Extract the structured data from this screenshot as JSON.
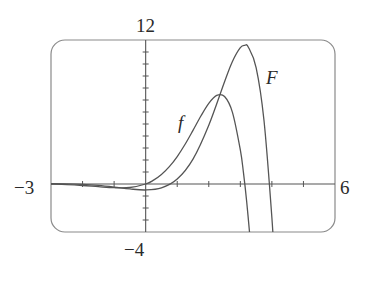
{
  "chart_data": {
    "type": "line",
    "title": "",
    "xlabel": "",
    "ylabel": "",
    "xlim": [
      -3,
      6
    ],
    "ylim": [
      -4,
      12
    ],
    "x_tick_step": 1,
    "y_tick_step": 1,
    "grid": false,
    "legend": "inline curve labels",
    "axis_labels": {
      "x_min": "−3",
      "x_max": "6",
      "y_max": "12",
      "y_min": "−4"
    },
    "series": [
      {
        "name": "f",
        "label": "f",
        "points": [
          [
            -3,
            -0.007
          ],
          [
            -2.5,
            -0.049
          ],
          [
            -2,
            -0.123
          ],
          [
            -1.5,
            -0.223
          ],
          [
            -1,
            -0.31
          ],
          [
            -0.5,
            -0.291
          ],
          [
            0,
            0
          ],
          [
            0.25,
            0.318
          ],
          [
            0.5,
            0.79
          ],
          [
            0.75,
            1.443
          ],
          [
            1,
            2.287
          ],
          [
            1.25,
            3.312
          ],
          [
            1.5,
            4.47
          ],
          [
            1.75,
            5.663
          ],
          [
            2,
            6.719
          ],
          [
            2.25,
            7.382
          ],
          [
            2.5,
            7.29
          ],
          [
            2.75,
            5.97
          ],
          [
            3,
            2.834
          ],
          [
            3.1,
            0.923
          ],
          [
            3.2,
            -1.433
          ],
          [
            3.3,
            -4.276
          ]
        ]
      },
      {
        "name": "F",
        "label": "F",
        "points": [
          [
            -3,
            0.021
          ],
          [
            -2.5,
            0.008
          ],
          [
            -2,
            -0.033
          ],
          [
            -1.5,
            -0.119
          ],
          [
            -1,
            -0.254
          ],
          [
            -0.5,
            -0.412
          ],
          [
            0,
            -0.5
          ],
          [
            0.5,
            -0.328
          ],
          [
            1,
            0.409
          ],
          [
            1.5,
            2.077
          ],
          [
            2,
            4.897
          ],
          [
            2.5,
            8.524
          ],
          [
            2.75,
            10.21
          ],
          [
            3,
            11.36
          ],
          [
            3.14,
            11.55
          ],
          [
            3.25,
            11.42
          ],
          [
            3.5,
            9.7
          ],
          [
            3.75,
            5.29
          ],
          [
            4,
            -2.817
          ],
          [
            4.1,
            -7.35
          ]
        ]
      }
    ],
    "annotations": [
      {
        "text": "f",
        "x": 1.35,
        "y": 5.6
      },
      {
        "text": "F",
        "x": 3.95,
        "y": 10.0
      }
    ]
  },
  "colors": {
    "frame": "#8a8a8a",
    "axes": "#555555",
    "curve": "#555555",
    "text": "#2a2a2a"
  }
}
